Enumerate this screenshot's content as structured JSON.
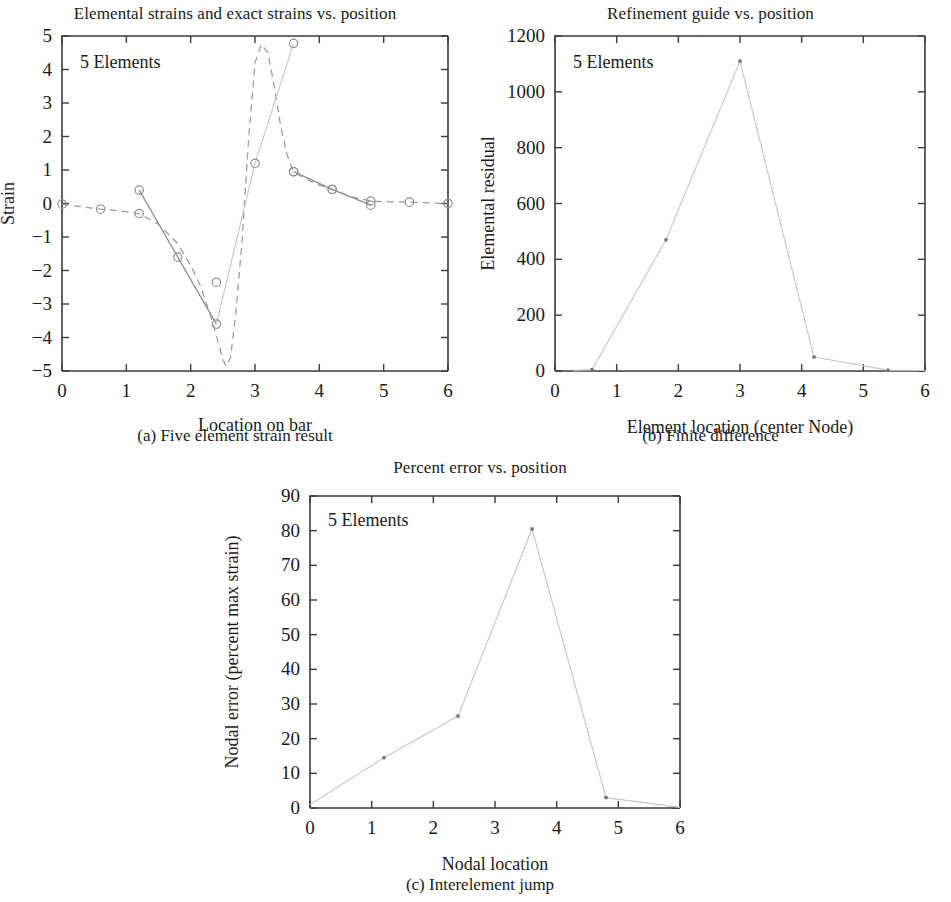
{
  "figure": {
    "panels": [
      {
        "key": "a",
        "title": "Elemental strains and exact strains vs. position",
        "caption": "(a) Five element strain result",
        "annotation": "5 Elements"
      },
      {
        "key": "b",
        "title": "Refinement guide vs. position",
        "caption": "(b) Finite difference",
        "annotation": "5 Elements"
      },
      {
        "key": "c",
        "title": "Percent error vs. position",
        "caption": "(c) Interelement jump",
        "annotation": "5 Elements"
      }
    ]
  },
  "chart_data": [
    {
      "type": "line",
      "panel": "a",
      "title": "Elemental strains and exact strains vs. position",
      "caption": "(a) Five element strain result",
      "annotation": "5 Elements",
      "xlabel": "Location on bar",
      "ylabel": "Strain",
      "xlim": [
        0,
        6
      ],
      "ylim": [
        -5,
        5
      ],
      "xticks": [
        0,
        1,
        2,
        3,
        4,
        5,
        6
      ],
      "yticks": [
        -5,
        -4,
        -3,
        -2,
        -1,
        0,
        1,
        2,
        3,
        4,
        5
      ],
      "xticklabels": [
        "0",
        "1",
        "2",
        "3",
        "4",
        "5",
        "6"
      ],
      "yticklabels": [
        "−5",
        "−4",
        "−3",
        "−2",
        "−1",
        "0",
        "1",
        "2",
        "3",
        "4",
        "5"
      ],
      "grid": false,
      "legend": "none",
      "marker": "circle",
      "series": [
        {
          "name": "Exact strain",
          "style": "dashed",
          "color": "#9a9a9a",
          "x": [
            0.0,
            0.2,
            0.4,
            0.6,
            0.9,
            1.2,
            1.5,
            1.8,
            2.0,
            2.15,
            2.3,
            2.4,
            2.5,
            2.55,
            2.62,
            2.7,
            2.8,
            2.9,
            3.0,
            3.1,
            3.2,
            3.3,
            3.4,
            3.5,
            3.6,
            3.8,
            4.0,
            4.2,
            4.5,
            4.8,
            5.1,
            5.4,
            5.7,
            6.0
          ],
          "y": [
            -0.02,
            -0.07,
            -0.12,
            -0.17,
            -0.22,
            -0.3,
            -0.62,
            -1.2,
            -1.85,
            -2.45,
            -3.3,
            -3.95,
            -4.65,
            -4.85,
            -4.6,
            -3.3,
            -1.1,
            1.9,
            4.2,
            4.75,
            4.5,
            3.5,
            2.3,
            1.45,
            0.95,
            0.72,
            0.55,
            0.42,
            0.2,
            0.07,
            0.05,
            0.04,
            0.02,
            0.0
          ],
          "markers_x": [
            0.0,
            0.6,
            1.2,
            2.4,
            3.6,
            4.2,
            4.8,
            5.4,
            6.0
          ],
          "markers_y": [
            -0.02,
            -0.17,
            -0.3,
            -2.35,
            0.95,
            0.42,
            0.07,
            0.04,
            0.0
          ]
        },
        {
          "name": "Elemental strain",
          "style": "solid",
          "color": "#8d8d8d",
          "x": [
            1.2,
            1.8,
            2.4,
            3.0,
            3.6,
            4.2,
            4.8
          ],
          "y": [
            0.4,
            -1.6,
            -3.6,
            1.2,
            4.78,
            0.42,
            -0.05
          ],
          "segments": [
            {
              "x": [
                1.2,
                1.8,
                2.4
              ],
              "y": [
                0.4,
                -1.6,
                -3.6
              ]
            },
            {
              "x": [
                2.4,
                3.0,
                3.6
              ],
              "y": [
                -3.6,
                1.2,
                4.78
              ],
              "faint": true
            },
            {
              "x": [
                3.6,
                4.2,
                4.8
              ],
              "y": [
                0.95,
                0.42,
                -0.05
              ]
            }
          ],
          "markers_x": [
            1.2,
            1.8,
            2.4,
            3.0,
            3.6,
            3.6,
            4.2,
            4.8
          ],
          "markers_y": [
            0.4,
            -1.6,
            -3.6,
            1.2,
            4.78,
            0.95,
            0.42,
            -0.05
          ]
        }
      ]
    },
    {
      "type": "line",
      "panel": "b",
      "title": "Refinement guide vs. position",
      "caption": "(b) Finite difference",
      "annotation": "5 Elements",
      "xlabel": "Element location (center Node)",
      "ylabel": "Elemental residual",
      "xlim": [
        0,
        6
      ],
      "ylim": [
        0,
        1200
      ],
      "xticks": [
        0,
        1,
        2,
        3,
        4,
        5,
        6
      ],
      "yticks": [
        0,
        200,
        400,
        600,
        800,
        1000,
        1200
      ],
      "xticklabels": [
        "0",
        "1",
        "2",
        "3",
        "4",
        "5",
        "6"
      ],
      "yticklabels": [
        "0",
        "200",
        "400",
        "600",
        "800",
        "1000",
        "1200"
      ],
      "grid": false,
      "legend": "none",
      "marker": "dot",
      "series": [
        {
          "name": "Elemental residual",
          "style": "faint",
          "color": "#c9c9c9",
          "x": [
            0.3,
            0.6,
            1.8,
            3.0,
            4.2,
            5.4,
            6.0
          ],
          "y": [
            2,
            5,
            470,
            1110,
            50,
            3,
            2
          ],
          "markers_x": [
            0.6,
            1.8,
            3.0,
            4.2,
            5.4
          ],
          "markers_y": [
            5,
            470,
            1110,
            50,
            3
          ]
        }
      ]
    },
    {
      "type": "line",
      "panel": "c",
      "title": "Percent error vs. position",
      "caption": "(c) Interelement jump",
      "annotation": "5 Elements",
      "xlabel": "Nodal location",
      "ylabel": "Nodal error (percent max strain)",
      "xlim": [
        0,
        6
      ],
      "ylim": [
        0,
        90
      ],
      "xticks": [
        0,
        1,
        2,
        3,
        4,
        5,
        6
      ],
      "yticks": [
        0,
        10,
        20,
        30,
        40,
        50,
        60,
        70,
        80,
        90
      ],
      "xticklabels": [
        "0",
        "1",
        "2",
        "3",
        "4",
        "5",
        "6"
      ],
      "yticklabels": [
        "0",
        "10",
        "20",
        "30",
        "40",
        "50",
        "60",
        "70",
        "80",
        "90"
      ],
      "grid": false,
      "legend": "none",
      "marker": "dot",
      "series": [
        {
          "name": "Nodal error",
          "style": "faint",
          "color": "#c9c9c9",
          "x": [
            0.0,
            1.2,
            2.4,
            3.6,
            4.8,
            6.0
          ],
          "y": [
            1.0,
            14.5,
            26.5,
            80.5,
            3.0,
            0.2
          ],
          "markers_x": [
            1.2,
            2.4,
            3.6,
            4.8
          ],
          "markers_y": [
            14.5,
            26.5,
            80.5,
            3.0
          ]
        }
      ]
    }
  ]
}
